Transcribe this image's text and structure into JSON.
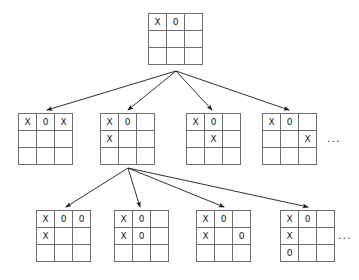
{
  "diagram": {
    "marks": {
      "x": "X",
      "o": "0",
      "empty": ""
    },
    "colors": {
      "grid_line": "#6e6e6e",
      "edge": "#1a1a1a",
      "mark": "#1a1a1a",
      "background": "#ffffff"
    },
    "ellipsis_label": "...",
    "levels": [
      {
        "level": 0,
        "nodes": [
          {
            "id": "root",
            "x": 148,
            "y": 13,
            "cells": [
              [
                "X",
                "0",
                ""
              ],
              [
                "",
                "",
                ""
              ],
              [
                "",
                "",
                ""
              ]
            ]
          }
        ]
      },
      {
        "level": 1,
        "nodes": [
          {
            "id": "n1-1",
            "x": 18,
            "y": 113,
            "cells": [
              [
                "X",
                "0",
                "X"
              ],
              [
                "",
                "",
                ""
              ],
              [
                "",
                "",
                ""
              ]
            ]
          },
          {
            "id": "n1-2",
            "x": 100,
            "y": 113,
            "cells": [
              [
                "X",
                "0",
                ""
              ],
              [
                "X",
                "",
                ""
              ],
              [
                "",
                "",
                ""
              ]
            ]
          },
          {
            "id": "n1-3",
            "x": 186,
            "y": 113,
            "cells": [
              [
                "X",
                "0",
                ""
              ],
              [
                "",
                "X",
                ""
              ],
              [
                "",
                "",
                ""
              ]
            ]
          },
          {
            "id": "n1-4",
            "x": 262,
            "y": 113,
            "cells": [
              [
                "X",
                "0",
                ""
              ],
              [
                "",
                "",
                "X"
              ],
              [
                "",
                "",
                ""
              ]
            ]
          }
        ]
      },
      {
        "level": 2,
        "nodes": [
          {
            "id": "n2-1",
            "x": 36,
            "y": 210,
            "cells": [
              [
                "X",
                "0",
                "0"
              ],
              [
                "X",
                "",
                ""
              ],
              [
                "",
                "",
                ""
              ]
            ]
          },
          {
            "id": "n2-2",
            "x": 114,
            "y": 210,
            "cells": [
              [
                "X",
                "0",
                ""
              ],
              [
                "X",
                "0",
                ""
              ],
              [
                "",
                "",
                ""
              ]
            ]
          },
          {
            "id": "n2-3",
            "x": 196,
            "y": 210,
            "cells": [
              [
                "X",
                "0",
                ""
              ],
              [
                "X",
                "",
                "0"
              ],
              [
                "",
                "",
                ""
              ]
            ]
          },
          {
            "id": "n2-4",
            "x": 280,
            "y": 210,
            "cells": [
              [
                "X",
                "0",
                ""
              ],
              [
                "X",
                "",
                ""
              ],
              [
                "0",
                "",
                ""
              ]
            ]
          }
        ]
      }
    ],
    "ellipses": [
      {
        "id": "ellipsis-level1",
        "x": 327,
        "y": 133
      },
      {
        "id": "ellipsis-level2",
        "x": 338,
        "y": 230
      }
    ],
    "edges": [
      {
        "id": "e-root-1",
        "from": "root",
        "to": "n1-1",
        "x1": 176,
        "y1": 71,
        "x2": 47,
        "y2": 110
      },
      {
        "id": "e-root-2",
        "from": "root",
        "to": "n1-2",
        "x1": 176,
        "y1": 71,
        "x2": 128,
        "y2": 110
      },
      {
        "id": "e-root-3",
        "from": "root",
        "to": "n1-3",
        "x1": 176,
        "y1": 71,
        "x2": 212,
        "y2": 110
      },
      {
        "id": "e-root-4",
        "from": "root",
        "to": "n1-4",
        "x1": 176,
        "y1": 71,
        "x2": 289,
        "y2": 110
      },
      {
        "id": "e-n12-1",
        "from": "n1-2",
        "to": "n2-1",
        "x1": 128,
        "y1": 168,
        "x2": 66,
        "y2": 207
      },
      {
        "id": "e-n12-2",
        "from": "n1-2",
        "to": "n2-2",
        "x1": 128,
        "y1": 168,
        "x2": 140,
        "y2": 207
      },
      {
        "id": "e-n12-3",
        "from": "n1-2",
        "to": "n2-3",
        "x1": 128,
        "y1": 168,
        "x2": 224,
        "y2": 207
      },
      {
        "id": "e-n12-4",
        "from": "n1-2",
        "to": "n2-4",
        "x1": 128,
        "y1": 168,
        "x2": 308,
        "y2": 207
      }
    ]
  }
}
